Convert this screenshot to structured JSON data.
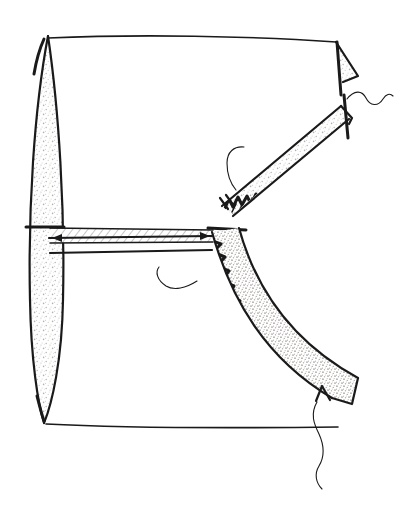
{
  "figure": {
    "medium": "pen and ink line drawing with stipple shading",
    "background_color": "#ffffff",
    "ink_color": "#1a1a1a",
    "stipple_color": "#d8d6d2",
    "width": 413,
    "height": 512,
    "caption": ""
  },
  "parts": {
    "leaf": {
      "name": "vertical lens element",
      "description": "tall pointed lens or leaf shaped form on the left, stipple shaded",
      "center_x": 45,
      "top_y": 36,
      "bottom_y": 424,
      "max_width": 36
    },
    "enclosure": {
      "name": "outer boundary outline",
      "description": "thin top and bottom edges spanning left lens tips to right side",
      "top_y": 36,
      "bottom_y": 427,
      "left_x": 45,
      "right_x": 360
    },
    "crossbar": {
      "name": "horizontal dimension bar",
      "description": "hatched horizontal band with arrow ends spanning from lens to curved band",
      "left_x": 48,
      "right_x": 212,
      "top_y": 227,
      "bottom_y": 243,
      "arrow_left": true,
      "arrow_right": true
    },
    "upper_band": {
      "name": "upper sawtooth band",
      "description": "narrow arcing band running up to the right with dense zigzag teeth on its upper edge",
      "start_x": 222,
      "start_y": 205,
      "end_x": 345,
      "end_y": 112,
      "tooth_count": 26
    },
    "lower_band": {
      "name": "lower crescent band",
      "description": "thick stipple shaded crescent curving down and right with sawtooth teeth along the inner edge",
      "start_x": 212,
      "start_y": 232,
      "end_x": 350,
      "end_y": 405,
      "tooth_count": 17
    },
    "wedge": {
      "name": "top right corner wedge",
      "description": "small stipple shaded triangular wedge at upper right corner",
      "x": 330,
      "y": 40,
      "width": 28,
      "height": 42
    },
    "tail_wedge": {
      "name": "bottom right end wedge",
      "description": "small stipple shaded wedge at the lower end of the crescent band",
      "x": 330,
      "y": 385,
      "width": 26,
      "height": 40
    }
  },
  "leaders": [
    {
      "name": "upper-right wavy leader",
      "description": "wavy squiggle line running right from the top of the upper band",
      "start_x": 346,
      "start_y": 100,
      "end_x": 392,
      "end_y": 96
    },
    {
      "name": "upper band hook leader",
      "description": "short hooked leader curving left off the lower end of the upper band",
      "start_x": 243,
      "start_y": 150,
      "end_x": 232,
      "end_y": 190
    },
    {
      "name": "center hook leader",
      "description": "hooked leader curving left from the zigzag edge near the centre",
      "start_x": 196,
      "start_y": 282,
      "end_x": 158,
      "end_y": 268
    },
    {
      "name": "bottom wavy leader",
      "description": "long wavy leader descending below the lower band end wedge",
      "start_x": 318,
      "start_y": 405,
      "end_x": 322,
      "end_y": 489
    }
  ]
}
